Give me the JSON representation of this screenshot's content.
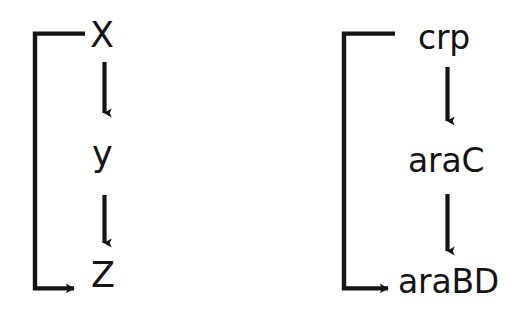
{
  "figure": {
    "background_color": "#ffffff",
    "stroke_color": "#141414",
    "width": 528,
    "height": 314
  },
  "diagrams": [
    {
      "id": "abstract",
      "name": "feed-forward-loop-abstract",
      "nodes": [
        {
          "id": "x",
          "label": "X"
        },
        {
          "id": "y",
          "label": "y"
        },
        {
          "id": "z",
          "label": "Z"
        }
      ],
      "edges": [
        {
          "from": "X",
          "to": "y",
          "kind": "activation",
          "shape": "straight-down"
        },
        {
          "from": "y",
          "to": "Z",
          "kind": "activation",
          "shape": "straight-down"
        },
        {
          "from": "X",
          "to": "Z",
          "kind": "activation",
          "shape": "bracket-left-bypass"
        }
      ]
    },
    {
      "id": "concrete",
      "name": "feed-forward-loop-ara-system",
      "nodes": [
        {
          "id": "crp",
          "label": "crp"
        },
        {
          "id": "arac",
          "label": "araC"
        },
        {
          "id": "arabd",
          "label": "araBD"
        }
      ],
      "edges": [
        {
          "from": "crp",
          "to": "araC",
          "kind": "activation",
          "shape": "straight-down"
        },
        {
          "from": "araC",
          "to": "araBD",
          "kind": "activation",
          "shape": "straight-down"
        },
        {
          "from": "crp",
          "to": "araBD",
          "kind": "activation",
          "shape": "bracket-left-bypass"
        }
      ]
    }
  ]
}
